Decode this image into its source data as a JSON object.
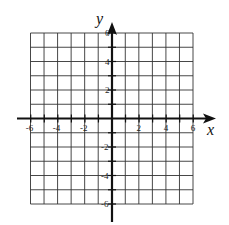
{
  "graph": {
    "x_axis_label": "x",
    "y_axis_label": "y",
    "x_range": [
      -6,
      6
    ],
    "y_range": [
      -6,
      6
    ],
    "grid_step": 1,
    "x_tick_labels": [
      "-6",
      "-4",
      "-2",
      "2",
      "4",
      "6"
    ],
    "y_tick_labels": [
      "6",
      "4",
      "2",
      "-2",
      "-4",
      "-6"
    ],
    "colors": {
      "grid": "#333333",
      "axis": "#111111",
      "background": "#ffffff"
    }
  }
}
